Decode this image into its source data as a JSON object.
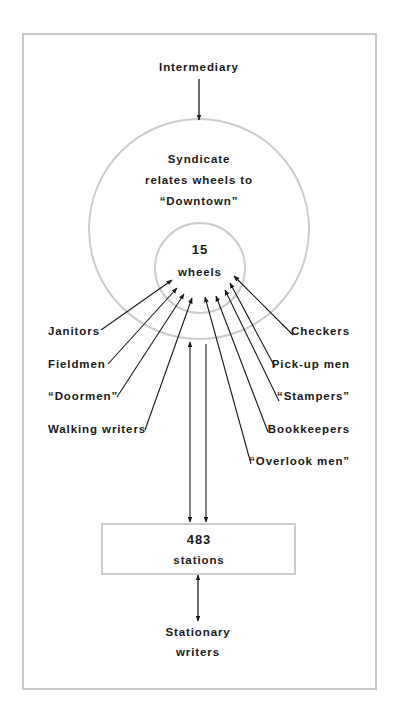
{
  "diagram": {
    "top_node": {
      "label": "Intermediary"
    },
    "outer_ring": {
      "lines": [
        "Syndicate",
        "relates wheels to",
        "“Downtown”"
      ]
    },
    "inner_circle": {
      "count": "15",
      "unit": "wheels"
    },
    "left_roles": [
      {
        "label": "Janitors"
      },
      {
        "label": "Fieldmen"
      },
      {
        "label": "“Doormen”"
      },
      {
        "label": "Walking writers"
      }
    ],
    "right_roles": [
      {
        "label": "Checkers"
      },
      {
        "label": "Pick-up men"
      },
      {
        "label": "“Stampers”"
      },
      {
        "label": "Bookkeepers"
      },
      {
        "label": "“Overlook men”"
      }
    ],
    "stations_box": {
      "count": "483",
      "unit": "stations"
    },
    "bottom_node": {
      "lines": [
        "Stationary",
        "writers"
      ]
    },
    "colors": {
      "frame": "#c9c9c9",
      "circle": "#cccccc",
      "arrow": "#1a1a1a",
      "text": "#1a1a1a"
    }
  }
}
